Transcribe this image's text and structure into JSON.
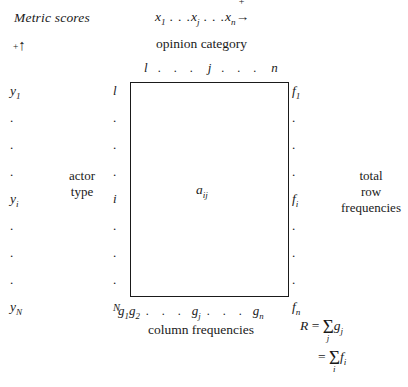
{
  "figure": {
    "metric_scores_label": "Metric scores",
    "vertical_axis_marker": {
      "plus": "+",
      "arrow": "↑"
    },
    "top_axis": {
      "x1": "x",
      "x1_sub": "1",
      "dots_a": " . . .",
      "xj": "x",
      "xj_sub": "j",
      "dots_b": " . . .",
      "xn": "x",
      "xn_sub": "n",
      "arrow": "→",
      "arrow_plus": "+"
    },
    "opinion_category_label": "opinion category",
    "column_index_header": {
      "first": "l",
      "dots_a": ". . .",
      "middle": "j",
      "dots_b": ". . .",
      "last": "n"
    },
    "matrix": {
      "cell_label": "a",
      "cell_sub": "ij"
    },
    "y_column": [
      {
        "type": "value",
        "symbol": "y",
        "sub": "1"
      },
      {
        "type": "dot",
        "symbol": "."
      },
      {
        "type": "dot",
        "symbol": "."
      },
      {
        "type": "dot",
        "symbol": "."
      },
      {
        "type": "value",
        "symbol": "y",
        "sub": "i"
      },
      {
        "type": "dot",
        "symbol": "."
      },
      {
        "type": "dot",
        "symbol": "."
      },
      {
        "type": "dot",
        "symbol": "."
      },
      {
        "type": "value",
        "symbol": "y",
        "sub": "N"
      }
    ],
    "row_index_column": [
      {
        "type": "value",
        "symbol": "l"
      },
      {
        "type": "dot",
        "symbol": "."
      },
      {
        "type": "dot",
        "symbol": "."
      },
      {
        "type": "dot",
        "symbol": "."
      },
      {
        "type": "value",
        "symbol": "i"
      },
      {
        "type": "dot",
        "symbol": "."
      },
      {
        "type": "dot",
        "symbol": "."
      },
      {
        "type": "dot",
        "symbol": "."
      },
      {
        "type": "value",
        "symbol": "N",
        "small": true
      }
    ],
    "f_column": [
      {
        "type": "value",
        "symbol": "f",
        "sub": "1"
      },
      {
        "type": "dot",
        "symbol": "."
      },
      {
        "type": "dot",
        "symbol": "."
      },
      {
        "type": "dot",
        "symbol": "."
      },
      {
        "type": "value",
        "symbol": "f",
        "sub": "i"
      },
      {
        "type": "dot",
        "symbol": "."
      },
      {
        "type": "dot",
        "symbol": "."
      },
      {
        "type": "dot",
        "symbol": "."
      },
      {
        "type": "value",
        "symbol": "f",
        "sub": "n"
      }
    ],
    "actor_type_label_line1": "actor",
    "actor_type_label_line2": "type",
    "total_row_frequencies_line1": "total",
    "total_row_frequencies_line2": "row",
    "total_row_frequencies_line3": "frequencies",
    "g_row": {
      "g1": "g",
      "g1_sub": "1",
      "g2": "g",
      "g2_sub": "2",
      "dots_a": ". . .",
      "gj": "g",
      "gj_sub": "j",
      "dots_b": ". . .",
      "gn": "g",
      "gn_sub": "n"
    },
    "column_frequencies_label": "column frequencies",
    "grand_total": {
      "r_symbol": "R",
      "equals": "=",
      "sigma": "Σ",
      "sum1_index": "j",
      "sum1_term": "g",
      "sum1_term_sub": "j",
      "equals2": "=",
      "sum2_index": "i",
      "sum2_term": "f",
      "sum2_term_sub": "i"
    }
  },
  "colors": {
    "ink": "#1a1a1a",
    "paper": "#ffffff"
  }
}
